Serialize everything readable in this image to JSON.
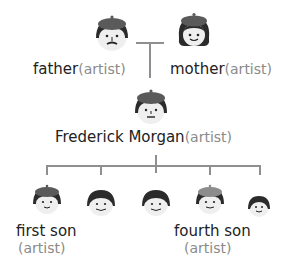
{
  "diagram": {
    "type": "family-tree",
    "parents": [
      {
        "name": "father",
        "role": "(artist)",
        "hair": "beret-mustache"
      },
      {
        "name": "mother",
        "role": "(artist)",
        "hair": "beret-bob"
      }
    ],
    "subject": {
      "name": "Frederick Morgan",
      "role": "(artist)"
    },
    "children": [
      {
        "name": "first son",
        "role": "(artist)",
        "beret": true
      },
      {
        "name": "",
        "role": "",
        "beret": false
      },
      {
        "name": "",
        "role": "",
        "beret": false
      },
      {
        "name": "fourth son",
        "role": "(artist)",
        "beret": true
      },
      {
        "name": "",
        "role": "",
        "beret": false
      }
    ],
    "colors": {
      "line": "#8f8f8f",
      "hair": "#2b2b2b",
      "beret": "#5a5a5a",
      "beret_light": "#8c8c8c",
      "skin": "#efefef",
      "text": "#222222",
      "role_text": "#8a8a8a"
    }
  }
}
